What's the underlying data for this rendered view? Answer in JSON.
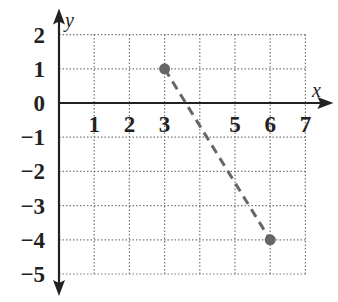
{
  "chart_data": {
    "type": "line",
    "title": "",
    "xlabel": "x",
    "ylabel": "y",
    "xlim": [
      0,
      7
    ],
    "ylim": [
      -5,
      2
    ],
    "grid": true,
    "grid_style": "dotted",
    "x_ticks": [
      "1",
      "2",
      "3",
      "5",
      "6",
      "7"
    ],
    "y_ticks": [
      "2",
      "1",
      "0",
      "−1",
      "−2",
      "−3",
      "−4",
      "−5"
    ],
    "series": [
      {
        "name": "segment",
        "style": "dashed",
        "color": "#666666",
        "points": [
          {
            "x": 3,
            "y": 1
          },
          {
            "x": 6,
            "y": -4
          }
        ]
      }
    ],
    "legend": null
  }
}
